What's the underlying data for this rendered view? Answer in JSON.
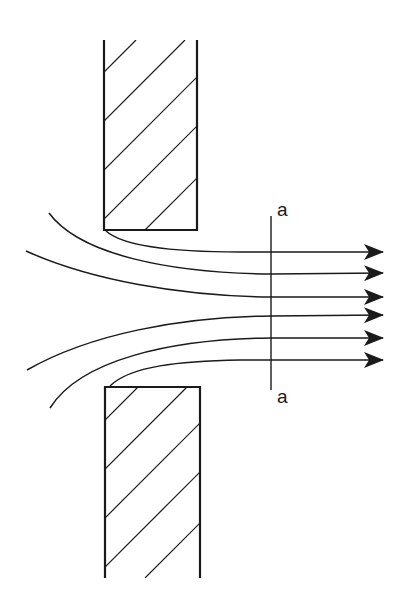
{
  "diagram": {
    "section_line": {
      "label_top": "a",
      "label_bottom": "a"
    },
    "walls": [
      {
        "name": "upper-wall",
        "hatched": true
      },
      {
        "name": "lower-wall",
        "hatched": true
      }
    ],
    "streamlines": 6,
    "colors": {
      "stroke": "#1a1a1a",
      "background": "#ffffff"
    }
  }
}
